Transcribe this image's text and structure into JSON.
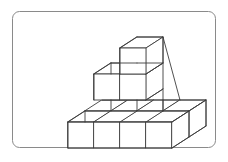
{
  "figure": {
    "title": "Isometric cube stack illustration",
    "kind": "line-drawing",
    "background_color": "#ffffff",
    "frame": {
      "name": "rounded-rectangle-border",
      "x": 12,
      "y": 11,
      "width": 204,
      "height": 137,
      "corner_radius": 7,
      "stroke_color": "#8a8a8a",
      "stroke_width": 1,
      "fill_color": "#ffffff"
    },
    "drawing": {
      "stroke_color": "#3c3c3c",
      "stroke_width": 0.9,
      "face_fill_color": "#ffffff",
      "projection": "isometric",
      "cube_size_px": 26,
      "axis_x_px": [
        26,
        0
      ],
      "axis_y_px": [
        -17,
        -11
      ],
      "axis_z_px": [
        0,
        -26
      ],
      "origin_px": [
        68,
        133
      ],
      "cube_count": 11,
      "cubes": [
        {
          "label": "bottom-front-left",
          "grid": [
            0,
            0,
            0
          ]
        },
        {
          "label": "bottom-front-mid-left",
          "grid": [
            1,
            0,
            0
          ]
        },
        {
          "label": "bottom-front-mid-right",
          "grid": [
            2,
            0,
            0
          ]
        },
        {
          "label": "bottom-front-right",
          "grid": [
            3,
            0,
            0
          ]
        },
        {
          "label": "bottom-back-left",
          "grid": [
            0,
            1,
            0
          ]
        },
        {
          "label": "bottom-back-mid-left",
          "grid": [
            1,
            1,
            0
          ]
        },
        {
          "label": "bottom-back-mid-right",
          "grid": [
            2,
            1,
            0
          ]
        },
        {
          "label": "bottom-back-right",
          "grid": [
            3,
            1,
            0
          ]
        },
        {
          "label": "middle-left",
          "grid": [
            1,
            1,
            1
          ]
        },
        {
          "label": "middle-right",
          "grid": [
            2,
            1,
            1
          ]
        },
        {
          "label": "top-cube",
          "grid": [
            2,
            1,
            2
          ]
        }
      ]
    }
  }
}
